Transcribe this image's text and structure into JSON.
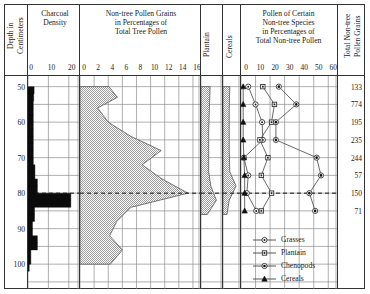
{
  "panels": {
    "depth": {
      "title_line1": "Depth in",
      "title_line2": "Centimeters",
      "ticks": [
        50,
        60,
        70,
        80,
        90,
        100
      ]
    },
    "charcoal": {
      "title_line1": "Charcoal",
      "title_line2": "Density",
      "ticks": [
        0,
        10,
        20
      ],
      "axis_max": 25
    },
    "nontree": {
      "title_line1": "Non-tree Pollen Grains",
      "title_line2": "in Percentages of",
      "title_line3": "Total Tree Pollen",
      "ticks": [
        0,
        2,
        4,
        6,
        8,
        10,
        12,
        14,
        16
      ],
      "axis_max": 17
    },
    "plantain": {
      "title": "Plantain"
    },
    "cereals": {
      "title": "Cereals"
    },
    "species": {
      "title_line1": "Pollen of Certain",
      "title_line2": "Non-tree Species",
      "title_line3": "in Percentages of",
      "title_line4": "Total Non-tree Pollen",
      "ticks": [
        0,
        10,
        20,
        30,
        40,
        50,
        60
      ],
      "axis_max": 66
    },
    "total": {
      "title_line1": "Total Non-tree",
      "title_line2": "Pollen Grains",
      "values": [
        {
          "depth": 50,
          "count": "133"
        },
        {
          "depth": 55,
          "count": "774"
        },
        {
          "depth": 60,
          "count": "195"
        },
        {
          "depth": 65,
          "count": "235"
        },
        {
          "depth": 70,
          "count": "244"
        },
        {
          "depth": 75,
          "count": "57"
        },
        {
          "depth": 80,
          "count": "150"
        },
        {
          "depth": 85,
          "count": "71"
        }
      ]
    }
  },
  "chart_data": {
    "type": "line",
    "ylabel": "Depth in Centimeters",
    "ylim": [
      47,
      107
    ],
    "marker_depth_line": 80,
    "series": [
      {
        "name": "Charcoal Density",
        "type": "bar",
        "xlabel": "Charcoal Density",
        "xlim": [
          0,
          25
        ],
        "depths": [
          50,
          52,
          54,
          56,
          58,
          60,
          62,
          64,
          66,
          68,
          70,
          72,
          74,
          76,
          78,
          80,
          82,
          84,
          86,
          88,
          90,
          92,
          94,
          96,
          98,
          100
        ],
        "values": [
          3.0,
          2.8,
          2.6,
          2.6,
          2.6,
          2.6,
          2.6,
          2.6,
          2.6,
          2.6,
          2.6,
          3.4,
          3.4,
          4.6,
          4.6,
          21.0,
          21.0,
          3.2,
          3.2,
          2.2,
          2.2,
          4.6,
          4.6,
          1.4,
          1.4,
          0.6
        ]
      },
      {
        "name": "Non-tree Pollen",
        "type": "area",
        "xlabel": "Non-tree Pollen Grains in Percentages of Total Tree Pollen",
        "xlim": [
          0,
          17
        ],
        "depths": [
          50,
          53,
          56,
          60,
          64,
          68,
          72,
          76,
          80,
          84,
          88,
          92,
          96,
          100
        ],
        "values": [
          4.1,
          5.3,
          2.5,
          4.0,
          7.2,
          11.5,
          8.8,
          11.6,
          15.3,
          7.2,
          5.2,
          4.2,
          6.0,
          4.3
        ]
      },
      {
        "name": "Plantain",
        "type": "area",
        "xlim": [
          0,
          3
        ],
        "depths": [
          50,
          56,
          62,
          68,
          74,
          78,
          82,
          86
        ],
        "values": [
          1.3,
          1.2,
          1.1,
          1.1,
          1.1,
          1.4,
          2.2,
          0.9
        ]
      },
      {
        "name": "Cereals",
        "type": "area",
        "xlim": [
          0,
          3
        ],
        "depths": [
          50,
          56,
          62,
          68,
          74,
          78,
          82,
          86
        ],
        "values": [
          1.2,
          1.1,
          1.1,
          1.1,
          1.2,
          2.3,
          1.1,
          0.7
        ]
      },
      {
        "name": "Grasses",
        "type": "line",
        "marker": "circle-dot",
        "xlim": [
          0,
          66
        ],
        "depths": [
          50,
          55,
          60,
          65,
          70,
          75,
          80,
          85
        ],
        "values": [
          5.0,
          10.0,
          14.5,
          15.0,
          2.0,
          5.0,
          4.0,
          10.5
        ]
      },
      {
        "name": "Plantain",
        "type": "line",
        "marker": "square",
        "xlim": [
          0,
          66
        ],
        "depths": [
          50,
          55,
          60,
          65,
          70,
          75,
          80,
          85
        ],
        "values": [
          15.0,
          23.0,
          21.0,
          13.0,
          18.5,
          14.0,
          21.0,
          14.0
        ]
      },
      {
        "name": "Chenopods",
        "type": "line",
        "marker": "circle",
        "xlim": [
          0,
          66
        ],
        "depths": [
          50,
          55,
          60,
          65,
          70,
          75,
          80,
          85
        ],
        "values": [
          26.0,
          38.0,
          24.0,
          24.0,
          52.0,
          55.0,
          47.0,
          51.0
        ]
      },
      {
        "name": "Cereals",
        "type": "line",
        "marker": "triangle",
        "xlim": [
          0,
          66
        ],
        "depths": [
          50,
          55,
          60,
          65,
          70,
          75,
          80,
          85
        ],
        "values": [
          1.5,
          1.5,
          1.5,
          1.5,
          2.0,
          2.5,
          2.5,
          2.5
        ]
      }
    ]
  },
  "legend": {
    "position": "bottom-right",
    "items": [
      {
        "label": "Grasses",
        "marker": "circle-dot"
      },
      {
        "label": "Plantain",
        "marker": "square"
      },
      {
        "label": "Chenopods",
        "marker": "circle"
      },
      {
        "label": "Cereals",
        "marker": "triangle"
      }
    ]
  }
}
